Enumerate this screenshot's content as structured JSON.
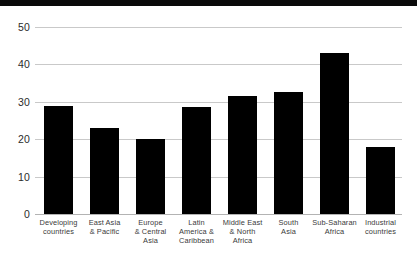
{
  "chart_data": {
    "type": "bar",
    "title": "",
    "subtitle": "",
    "xlabel": "",
    "ylabel": "",
    "ylim": [
      0,
      50
    ],
    "yticks": [
      0,
      10,
      20,
      30,
      40,
      50
    ],
    "grid": true,
    "legend": false,
    "bar_color": "#000000",
    "grid_color": "#c9c9c9",
    "label_color": "#3a3a3a",
    "categories": [
      "Developing\ncountries",
      "East Asia\n& Pacific",
      "Europe\n& Central\nAsia",
      "Latin\nAmerica &\nCaribbean",
      "Middle East\n& North\nAfrica",
      "South\nAsia",
      "Sub-Saharan\nAfrica",
      "Industrial\ncountries"
    ],
    "values": [
      29,
      23,
      20,
      28.5,
      31.5,
      32.5,
      43,
      18
    ]
  },
  "axis": {
    "y_tick_0": "0",
    "y_tick_10": "10",
    "y_tick_20": "20",
    "y_tick_30": "30",
    "y_tick_40": "40",
    "y_tick_50": "50"
  },
  "labels": {
    "cat0": "Developing\ncountries",
    "cat1": "East Asia\n& Pacific",
    "cat2": "Europe\n& Central\nAsia",
    "cat3": "Latin\nAmerica &\nCaribbean",
    "cat4": "Middle East\n& North\nAfrica",
    "cat5": "South\nAsia",
    "cat6": "Sub-Saharan\nAfrica",
    "cat7": "Industrial\ncountries"
  }
}
